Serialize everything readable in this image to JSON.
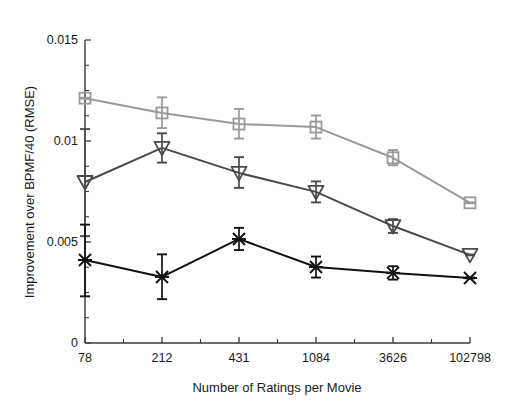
{
  "chart_data": {
    "type": "line",
    "title": "",
    "xlabel": "Number of Ratings per Movie",
    "ylabel": "Improvement over BPMF/40 (RMSE)",
    "categories": [
      "78",
      "212",
      "431",
      "1084",
      "3626",
      "102798"
    ],
    "ylim": [
      0,
      0.015
    ],
    "ytick_labels": [
      "0",
      "0.005",
      "0.01",
      "0.015"
    ],
    "ytick_values": [
      0,
      0.005,
      0.01,
      0.015
    ],
    "yticks_minor": [
      0.00125,
      0.0025,
      0.00375,
      0.00625,
      0.0075,
      0.00875,
      0.01125,
      0.0125,
      0.01375
    ],
    "grid": false,
    "legend": "none",
    "series": [
      {
        "name": "series-gray-square",
        "marker": "square",
        "color": "#9a9a9a",
        "values": [
          0.01212,
          0.01139,
          0.01084,
          0.01069,
          0.00917,
          0.00694
        ],
        "err_low": [
          2e-05,
          0.00075,
          0.00072,
          0.00057,
          0.00037,
          2e-05
        ],
        "err_high": [
          2e-05,
          0.00077,
          0.00075,
          0.00057,
          0.00038,
          2e-05
        ]
      },
      {
        "name": "series-dark-triangle",
        "marker": "triangle-down",
        "color": "#4a4a4a",
        "values": [
          0.00797,
          0.00966,
          0.00842,
          0.00748,
          0.00579,
          0.00436
        ],
        "err_low": [
          0.00268,
          0.00073,
          0.00074,
          0.00052,
          0.00034,
          2e-05
        ],
        "err_high": [
          0.00262,
          0.00072,
          0.00078,
          0.00052,
          0.00034,
          2e-05
        ]
      },
      {
        "name": "series-black-x",
        "marker": "x",
        "color": "#111111",
        "values": [
          0.00411,
          0.00327,
          0.00515,
          0.00376,
          0.00347,
          0.00322
        ],
        "err_low": [
          0.0018,
          0.0011,
          0.00055,
          0.00052,
          0.00033,
          2e-05
        ],
        "err_high": [
          0.00175,
          0.00112,
          0.00055,
          0.00052,
          0.00033,
          2e-05
        ]
      }
    ]
  },
  "axes": {
    "plot_left": 85,
    "plot_right": 470,
    "plot_top": 40,
    "plot_bottom": 343
  },
  "colors": {
    "series_gray": "#9a9a9a",
    "series_dark": "#4a4a4a",
    "series_black": "#111111",
    "axis": "#3a3a3a",
    "background": "#ffffff"
  }
}
